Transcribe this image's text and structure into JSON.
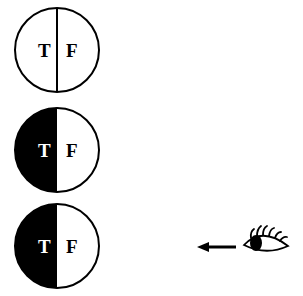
{
  "diagram": {
    "circles": [
      {
        "left_label": "T",
        "right_label": "F",
        "left_filled": false
      },
      {
        "left_label": "T",
        "right_label": "F",
        "left_filled": true
      },
      {
        "left_label": "T",
        "right_label": "F",
        "left_filled": true
      }
    ],
    "viewer": {
      "icon": "eye-icon",
      "arrow": "arrow-left-icon"
    },
    "colors": {
      "ink": "#000000",
      "paper": "#ffffff"
    }
  }
}
